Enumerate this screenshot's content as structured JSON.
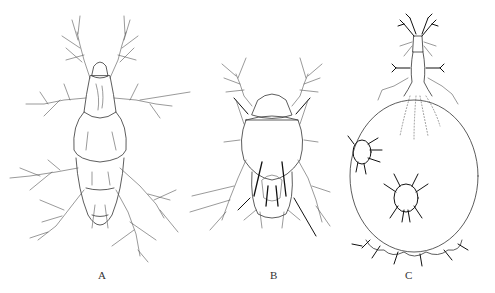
{
  "figure": {
    "panels": [
      {
        "id": "A",
        "label": "A",
        "subject": "mite dorsal view, elongate body with four pairs of legs"
      },
      {
        "id": "B",
        "label": "B",
        "subject": "mite dorsal view, compact body with prominent setae"
      },
      {
        "id": "C",
        "label": "C",
        "subject": "gravid female with swollen globular opisthosoma and emerging offspring"
      }
    ]
  },
  "colors": {
    "background": "#ffffff",
    "line": "#555555",
    "ink": "#111111",
    "label": "#333333"
  }
}
